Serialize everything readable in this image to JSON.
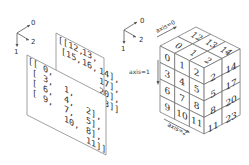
{
  "diagram": {
    "left_axes": {
      "labels": [
        "0",
        "1",
        "2"
      ]
    },
    "middle_axes": {
      "labels": [
        "0",
        "1",
        "2"
      ]
    },
    "array_text": {
      "back_plane_rows": [
        "[[12, 13, 14],",
        " [15, 16, 17],",
        " [18, 19, 20],",
        " [21, 22, 23]]]"
      ],
      "front_plane_rows": [
        "[[ 0,  1,  2],",
        " [ 3,  4,  5],",
        " [ 6,  7,  8],",
        " [ 9, 10, 11]],"
      ],
      "back_visible": [
        [
          "[[12,",
          "13,",
          ""
        ],
        [
          "[15,",
          "16,",
          "14],"
        ],
        [
          "",
          "",
          "17],"
        ],
        [
          "",
          "",
          "20],"
        ],
        [
          "",
          "",
          "23]]"
        ]
      ],
      "front_visible": [
        [
          "[[",
          "0,",
          "",
          ""
        ],
        [
          "[",
          "3,",
          "1,",
          ""
        ],
        [
          "[",
          "6,",
          "4,",
          "2],"
        ],
        [
          "[",
          "9,",
          "7,",
          "5],"
        ],
        [
          "",
          "",
          "10,",
          "8],"
        ],
        [
          "",
          "",
          "",
          "11]]"
        ]
      ]
    },
    "cube": {
      "axis_labels": {
        "axis0": "axis=0",
        "axis1": "axis=1",
        "axis2": "axis=2"
      },
      "top_face": [
        [
          "0",
          "12"
        ],
        [
          "1",
          "13"
        ],
        [
          "2",
          "14"
        ]
      ],
      "front_face": [
        [
          "0",
          "1",
          "2"
        ],
        [
          "3",
          "4",
          "5"
        ],
        [
          "6",
          "7",
          "8"
        ],
        [
          "9",
          "10",
          "11"
        ]
      ],
      "right_face": [
        [
          "2",
          "14"
        ],
        [
          "5",
          "17"
        ],
        [
          "8",
          "20"
        ],
        [
          "11",
          "23"
        ]
      ]
    },
    "colors": {
      "background": "#ffffff",
      "line": "#555555",
      "text": "#333333"
    }
  }
}
